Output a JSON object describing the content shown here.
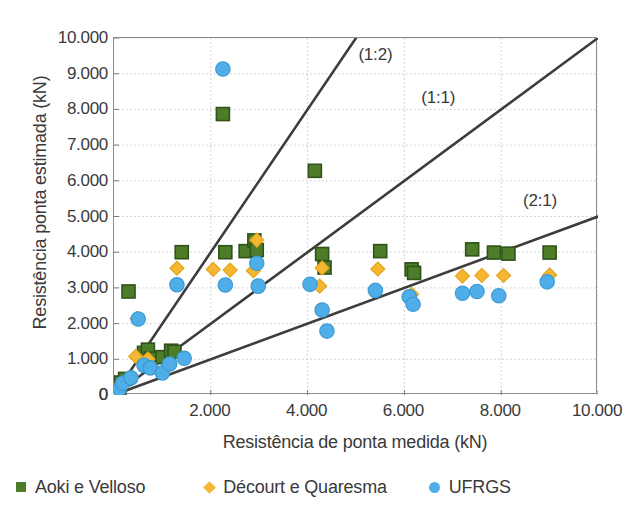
{
  "chart_data": {
    "type": "scatter",
    "title": "",
    "xlabel": "Resistência de ponta medida (kN)",
    "ylabel": "Resistência ponta estimada (kN)",
    "xlim": [
      0,
      10000
    ],
    "ylim": [
      0,
      10000
    ],
    "xticks": [
      0,
      2000,
      4000,
      6000,
      8000,
      10000
    ],
    "yticks": [
      0,
      1000,
      2000,
      3000,
      4000,
      5000,
      6000,
      7000,
      8000,
      9000,
      10000
    ],
    "xticklabels": [
      "0",
      "2.000",
      "4.000",
      "6.000",
      "8.000",
      "10.000"
    ],
    "yticklabels": [
      "0",
      "1.000",
      "2.000",
      "3.000",
      "4.000",
      "5.000",
      "6.000",
      "7.000",
      "8.000",
      "9.000",
      "10.000"
    ],
    "grid": true,
    "grid_style": "dotted",
    "grid_color": "#c8c8c8",
    "legend_position": "below-axes",
    "reference_lines": [
      {
        "label": "(1:2)",
        "slope": 2.0,
        "label_x": 5050,
        "label_y": 9550
      },
      {
        "label": "(1:1)",
        "slope": 1.0,
        "label_x": 6350,
        "label_y": 8350
      },
      {
        "label": "(2:1)",
        "slope": 0.5,
        "label_x": 8450,
        "label_y": 5450
      }
    ],
    "series": [
      {
        "name": "Aoki e Velloso",
        "color": "#4e7d2a",
        "edge_color": "#2f5318",
        "marker": "square",
        "points": [
          [
            110,
            200
          ],
          [
            150,
            350
          ],
          [
            230,
            450
          ],
          [
            300,
            2900
          ],
          [
            620,
            1180
          ],
          [
            700,
            1270
          ],
          [
            760,
            1020
          ],
          [
            1000,
            1060
          ],
          [
            1180,
            1240
          ],
          [
            1250,
            1210
          ],
          [
            1400,
            4000
          ],
          [
            2250,
            7870
          ],
          [
            2300,
            4000
          ],
          [
            2720,
            4030
          ],
          [
            2900,
            4330
          ],
          [
            2950,
            4060
          ],
          [
            4150,
            6280
          ],
          [
            4300,
            3950
          ],
          [
            4350,
            3570
          ],
          [
            5500,
            4030
          ],
          [
            6150,
            3520
          ],
          [
            6200,
            3420
          ],
          [
            7400,
            4080
          ],
          [
            7850,
            3990
          ],
          [
            8150,
            3960
          ],
          [
            9000,
            3990
          ]
        ]
      },
      {
        "name": "Décourt e Quaresma",
        "color": "#f5b731",
        "edge_color": "#e3a51e",
        "marker": "diamond",
        "points": [
          [
            90,
            180
          ],
          [
            140,
            300
          ],
          [
            250,
            400
          ],
          [
            450,
            1080
          ],
          [
            480,
            2140
          ],
          [
            700,
            1010
          ],
          [
            1300,
            3550
          ],
          [
            2050,
            3520
          ],
          [
            2400,
            3500
          ],
          [
            2880,
            3480
          ],
          [
            2950,
            4340
          ],
          [
            4250,
            3050
          ],
          [
            4300,
            3560
          ],
          [
            5450,
            3530
          ],
          [
            6150,
            2820
          ],
          [
            7200,
            3330
          ],
          [
            7600,
            3350
          ],
          [
            8050,
            3350
          ],
          [
            9000,
            3360
          ]
        ]
      },
      {
        "name": "UFRGS",
        "color": "#4faee8",
        "edge_color": "#3c9ad4",
        "marker": "circle",
        "points": [
          [
            100,
            150
          ],
          [
            180,
            330
          ],
          [
            350,
            480
          ],
          [
            500,
            2130
          ],
          [
            620,
            830
          ],
          [
            750,
            760
          ],
          [
            1000,
            620
          ],
          [
            1150,
            870
          ],
          [
            1300,
            3090
          ],
          [
            1450,
            1030
          ],
          [
            2250,
            9130
          ],
          [
            2300,
            3080
          ],
          [
            2950,
            3690
          ],
          [
            2980,
            3050
          ],
          [
            4050,
            3100
          ],
          [
            4300,
            2380
          ],
          [
            4400,
            1790
          ],
          [
            5400,
            2930
          ],
          [
            6100,
            2750
          ],
          [
            6180,
            2540
          ],
          [
            7200,
            2850
          ],
          [
            7500,
            2900
          ],
          [
            7950,
            2780
          ],
          [
            8950,
            3170
          ]
        ]
      }
    ]
  },
  "axis": {
    "x_title": "Resistência de ponta medida (kN)",
    "y_title": "Resistência ponta estimada (kN)"
  },
  "legend": {
    "items": [
      {
        "label": "Aoki e Velloso",
        "color": "#4e7d2a",
        "marker": "square"
      },
      {
        "label": "Décourt e Quaresma",
        "color": "#f5b731",
        "marker": "diamond"
      },
      {
        "label": "UFRGS",
        "color": "#4faee8",
        "marker": "circle"
      }
    ]
  }
}
